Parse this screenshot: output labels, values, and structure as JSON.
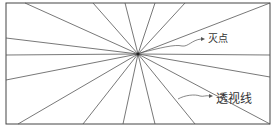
{
  "diagram": {
    "type": "one-point-perspective",
    "frame": {
      "x1": 6,
      "y1": 3,
      "x2": 270,
      "y2": 124
    },
    "vanishing_point": {
      "x": 138,
      "y": 54
    },
    "line_color": "#555555",
    "frame_color": "#444444",
    "rays": [
      {
        "x": 25,
        "y": 3
      },
      {
        "x": 93,
        "y": 3
      },
      {
        "x": 125,
        "y": 3
      },
      {
        "x": 155,
        "y": 3
      },
      {
        "x": 185,
        "y": 3
      },
      {
        "x": 270,
        "y": 3
      },
      {
        "x": 6,
        "y": 38
      },
      {
        "x": 6,
        "y": 55
      },
      {
        "x": 6,
        "y": 80
      },
      {
        "x": 270,
        "y": 55
      },
      {
        "x": 270,
        "y": 77
      },
      {
        "x": 270,
        "y": 124
      },
      {
        "x": 18,
        "y": 124
      },
      {
        "x": 83,
        "y": 124
      },
      {
        "x": 123,
        "y": 124
      },
      {
        "x": 155,
        "y": 124
      },
      {
        "x": 195,
        "y": 124
      }
    ],
    "labels": [
      {
        "id": "vanishing-point-label",
        "text": "灭点",
        "x": 208,
        "y": 34
      },
      {
        "id": "perspective-lines-label",
        "text": "透视线",
        "x": 216,
        "y": 93
      }
    ]
  }
}
